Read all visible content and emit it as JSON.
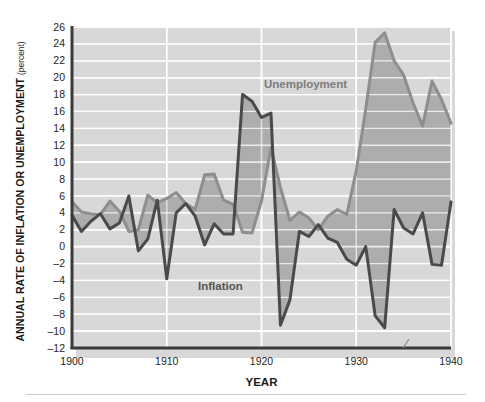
{
  "figure": {
    "background_color": "#ffffff",
    "plot_background_color": "#d8d8d8",
    "gridline_color": "#ffffff",
    "axis_color": "#3a3a3a",
    "border_shadow_color": "#b8b8b8"
  },
  "axes": {
    "y_axis_title_main": "ANNUAL RATE OF INFLATION OR UNEMPLOYMENT",
    "y_axis_title_unit": "(percent)",
    "x_axis_title": "YEAR"
  },
  "labels": {
    "unemployment": "Unemployment",
    "inflation": "Inflation"
  },
  "chart_data": {
    "type": "line",
    "title": "",
    "subtitle": "",
    "xlabel": "YEAR",
    "ylabel": "ANNUAL RATE OF INFLATION OR UNEMPLOYMENT (percent)",
    "xlim": [
      1900,
      1940
    ],
    "ylim": [
      -12,
      26
    ],
    "grid": true,
    "grid_axis": "both",
    "legend_position": "inline-annotation",
    "x_ticks": [
      1900,
      1910,
      1920,
      1930,
      1940
    ],
    "x_tick_labels": [
      "1900",
      "1910",
      "1920",
      "1930",
      "1940"
    ],
    "y_ticks": [
      -12,
      -10,
      -8,
      -6,
      -4,
      -2,
      0,
      2,
      4,
      6,
      8,
      10,
      12,
      14,
      16,
      18,
      20,
      22,
      24,
      26
    ],
    "y_tick_labels": [
      "–12",
      "–10",
      "–8",
      "–6",
      "–4",
      "–2",
      "0",
      "2",
      "4",
      "6",
      "8",
      "10",
      "12",
      "14",
      "16",
      "18",
      "20",
      "22",
      "24",
      "26"
    ],
    "x": [
      1900,
      1901,
      1902,
      1903,
      1904,
      1905,
      1906,
      1907,
      1908,
      1909,
      1910,
      1911,
      1912,
      1913,
      1914,
      1915,
      1916,
      1917,
      1918,
      1919,
      1920,
      1921,
      1922,
      1923,
      1924,
      1925,
      1926,
      1927,
      1928,
      1929,
      1930,
      1931,
      1932,
      1933,
      1934,
      1935,
      1936,
      1937,
      1938,
      1939,
      1940
    ],
    "series": [
      {
        "name": "Unemployment",
        "color": "#8e8e8e",
        "line_width": 3,
        "values": [
          5.3,
          4.1,
          3.9,
          3.8,
          5.4,
          4.2,
          1.8,
          2.0,
          6.1,
          5.2,
          5.7,
          6.4,
          5.1,
          4.4,
          8.5,
          8.6,
          5.5,
          5.0,
          1.7,
          1.6,
          5.4,
          11.7,
          7.0,
          3.1,
          4.1,
          3.4,
          2.0,
          3.6,
          4.4,
          3.8,
          9.0,
          16.3,
          24.2,
          25.3,
          22.0,
          20.3,
          17.0,
          14.3,
          19.6,
          17.4,
          14.6
        ]
      },
      {
        "name": "Inflation",
        "color": "#4a4a4a",
        "line_width": 3,
        "values": [
          3.7,
          1.8,
          3.0,
          3.9,
          2.1,
          2.8,
          6.0,
          -0.5,
          0.9,
          5.5,
          -3.8,
          4.0,
          5.1,
          3.6,
          0.2,
          2.7,
          1.5,
          1.5,
          18.0,
          17.2,
          15.3,
          15.8,
          -9.3,
          -6.3,
          1.8,
          1.2,
          2.6,
          1.0,
          0.5,
          -1.5,
          -2.2,
          0.0,
          -8.2,
          -9.6,
          4.4,
          2.2,
          1.5,
          4.0,
          -2.1,
          -2.2,
          5.3
        ]
      }
    ]
  }
}
